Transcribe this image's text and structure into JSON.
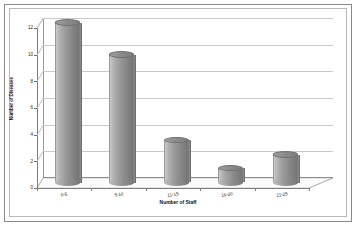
{
  "chart_data": {
    "type": "bar",
    "title": "",
    "subtitle": "",
    "categories": [
      "0-5",
      "5-10",
      "11-15",
      "16-20",
      "21-25"
    ],
    "values": [
      12,
      9.6,
      3.2,
      1.1,
      2.1
    ],
    "series": [
      {
        "name": "Number of Diseases",
        "values": [
          12,
          9.6,
          3.2,
          1.1,
          2.1
        ]
      }
    ],
    "xlabel": "Number of Staff",
    "ylabel": "Number of Diseases",
    "ylim": [
      0,
      12
    ],
    "ytick_labels": [
      "0",
      "2",
      "4",
      "6",
      "8",
      "10",
      "12"
    ],
    "ytick_values": [
      0,
      2,
      4,
      6,
      8,
      10,
      12
    ],
    "grid": true,
    "legend": false,
    "legend_position": "none",
    "style": "3d-cylinder",
    "bar_color": "#8d8d8d",
    "gridline_color": "#c9c9c9",
    "axis_color": "#7d7d7d",
    "background_color": "#ffffff",
    "frame_color": "#8a8a8a"
  },
  "axes": {
    "x_title": "Number of Staff",
    "y_title": "Number of Diseases"
  },
  "ticks": {
    "y": [
      {
        "label": "12",
        "value": 12
      },
      {
        "label": "10",
        "value": 10
      },
      {
        "label": "8",
        "value": 8
      },
      {
        "label": "6",
        "value": 6
      },
      {
        "label": "4",
        "value": 4
      },
      {
        "label": "2",
        "value": 2
      },
      {
        "label": "0",
        "value": 0
      }
    ],
    "x": [
      {
        "label": "0-5"
      },
      {
        "label": "5-10"
      },
      {
        "label": "11-15"
      },
      {
        "label": "16-20"
      },
      {
        "label": "21-25"
      }
    ]
  }
}
